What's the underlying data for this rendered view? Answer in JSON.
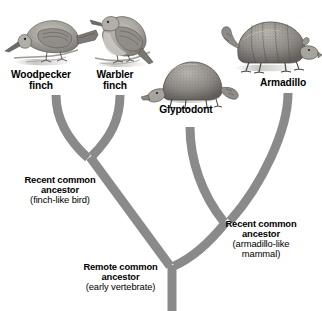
{
  "diagram": {
    "type": "phylogenetic-tree",
    "branch_color": "#8a8a8a",
    "text_color": "#000000",
    "background_color": "#ffffff"
  },
  "taxa": [
    {
      "id": "woodpecker-finch",
      "label_line1": "Woodpecker",
      "label_line2": "finch",
      "illustration": "bird-perched-head-down"
    },
    {
      "id": "warbler-finch",
      "label_line1": "Warbler",
      "label_line2": "finch",
      "illustration": "bird-perched-upright"
    },
    {
      "id": "glyptodont",
      "label_line1": "Glyptodont",
      "label_line2": "",
      "illustration": "armored-mammal-domed-shell"
    },
    {
      "id": "armadillo",
      "label_line1": "Armadillo",
      "label_line2": "",
      "illustration": "armadillo-banded-shell"
    }
  ],
  "nodes": [
    {
      "id": "recent-common-ancestor-finch",
      "heading_line1": "Recent common",
      "heading_line2": "ancestor",
      "subtitle_line1": "(finch-like bird)",
      "subtitle_line2": ""
    },
    {
      "id": "recent-common-ancestor-armadillo",
      "heading_line1": "Recent common",
      "heading_line2": "ancestor",
      "subtitle_line1": "(armadillo-like",
      "subtitle_line2": "mammal)"
    },
    {
      "id": "remote-common-ancestor",
      "heading_line1": "Remote common",
      "heading_line2": "ancestor",
      "subtitle_line1": "(early vertebrate)",
      "subtitle_line2": ""
    }
  ]
}
